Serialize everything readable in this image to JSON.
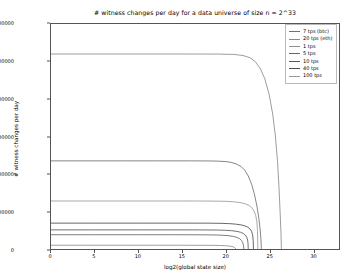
{
  "chart_data": {
    "type": "line",
    "title": "# witness changes per day for a data universe of size n = 2^33",
    "xlabel": "log2(global state size)",
    "ylabel": "# witness changes per day",
    "xlim": [
      0,
      33
    ],
    "ylim": [
      0,
      3000000
    ],
    "xticks": [
      0,
      5,
      10,
      15,
      20,
      25,
      30
    ],
    "xtick_labels": [
      "0",
      "5",
      "10",
      "15",
      "20",
      "25",
      "30"
    ],
    "yticks": [
      0,
      500000,
      1000000,
      1500000,
      2000000,
      2500000,
      3000000
    ],
    "ytick_labels": [
      "0",
      "500000",
      "1000000",
      "1500000",
      "2000000",
      "2500000",
      "3000000"
    ],
    "grid": false,
    "legend_position": "upper right",
    "series": [
      {
        "name": "7 tps (btc)",
        "color": "#707070",
        "plateau": 1175000,
        "dropoff_start": 20.0,
        "zero_at": 24.1,
        "points": [
          [
            0,
            1175000
          ],
          [
            4,
            1175000
          ],
          [
            8,
            1175000
          ],
          [
            12,
            1175000
          ],
          [
            16,
            1175000
          ],
          [
            18,
            1174000
          ],
          [
            19,
            1172000
          ],
          [
            20,
            1166000
          ],
          [
            20.6,
            1156000
          ],
          [
            21.2,
            1136000
          ],
          [
            21.8,
            1098000
          ],
          [
            22.2,
            1050000
          ],
          [
            22.6,
            975000
          ],
          [
            23.0,
            860000
          ],
          [
            23.3,
            735000
          ],
          [
            23.6,
            570000
          ],
          [
            23.8,
            420000
          ],
          [
            23.95,
            275000
          ],
          [
            24.05,
            140000
          ],
          [
            24.1,
            0
          ]
        ]
      },
      {
        "name": "20 tps (eth)",
        "color": "#8a8a8a",
        "plateau": 2600000,
        "dropoff_start": 21.5,
        "zero_at": 26.4,
        "points": [
          [
            0,
            2600000
          ],
          [
            5,
            2600000
          ],
          [
            10,
            2600000
          ],
          [
            15,
            2600000
          ],
          [
            19,
            2599000
          ],
          [
            21,
            2594000
          ],
          [
            22,
            2580000
          ],
          [
            22.8,
            2550000
          ],
          [
            23.4,
            2500000
          ],
          [
            24.0,
            2400000
          ],
          [
            24.5,
            2270000
          ],
          [
            25.0,
            2060000
          ],
          [
            25.4,
            1800000
          ],
          [
            25.7,
            1520000
          ],
          [
            25.95,
            1180000
          ],
          [
            26.12,
            830000
          ],
          [
            26.25,
            500000
          ],
          [
            26.35,
            220000
          ],
          [
            26.4,
            0
          ]
        ]
      },
      {
        "name": "1 tps",
        "color": "#8e8e8e",
        "plateau": 50000,
        "dropoff_start": 17.5,
        "zero_at": 21.2,
        "points": [
          [
            0,
            50000
          ],
          [
            4,
            50000
          ],
          [
            8,
            50000
          ],
          [
            12,
            50000
          ],
          [
            15,
            49900
          ],
          [
            17,
            49600
          ],
          [
            18,
            49100
          ],
          [
            18.8,
            48200
          ],
          [
            19.4,
            46800
          ],
          [
            19.9,
            44500
          ],
          [
            20.3,
            41000
          ],
          [
            20.6,
            36500
          ],
          [
            20.85,
            30000
          ],
          [
            21.0,
            21000
          ],
          [
            21.1,
            12000
          ],
          [
            21.2,
            0
          ]
        ]
      },
      {
        "name": "5 tps",
        "color": "#666666",
        "plateau": 190000,
        "dropoff_start": 18.4,
        "zero_at": 22.1,
        "points": [
          [
            0,
            190000
          ],
          [
            5,
            190000
          ],
          [
            10,
            190000
          ],
          [
            14,
            190000
          ],
          [
            16,
            189600
          ],
          [
            18,
            188500
          ],
          [
            19,
            186500
          ],
          [
            19.8,
            182500
          ],
          [
            20.4,
            176500
          ],
          [
            20.9,
            167500
          ],
          [
            21.3,
            154000
          ],
          [
            21.6,
            138000
          ],
          [
            21.82,
            116000
          ],
          [
            21.96,
            86000
          ],
          [
            22.05,
            50000
          ],
          [
            22.1,
            0
          ]
        ]
      },
      {
        "name": "10 tps",
        "color": "#5a5a5a",
        "plateau": 255000,
        "dropoff_start": 18.8,
        "zero_at": 22.6,
        "points": [
          [
            0,
            255000
          ],
          [
            5,
            255000
          ],
          [
            10,
            255000
          ],
          [
            15,
            255000
          ],
          [
            17,
            254600
          ],
          [
            19,
            253000
          ],
          [
            20,
            249500
          ],
          [
            20.7,
            244000
          ],
          [
            21.3,
            235000
          ],
          [
            21.7,
            224000
          ],
          [
            22.0,
            209000
          ],
          [
            22.25,
            188000
          ],
          [
            22.42,
            160000
          ],
          [
            22.53,
            120000
          ],
          [
            22.58,
            70000
          ],
          [
            22.6,
            0
          ]
        ]
      },
      {
        "name": "40 tps",
        "color": "#4e4e4e",
        "plateau": 345000,
        "dropoff_start": 19.3,
        "zero_at": 23.2,
        "points": [
          [
            0,
            345000
          ],
          [
            5,
            345000
          ],
          [
            10,
            345000
          ],
          [
            15,
            345000
          ],
          [
            18,
            344400
          ],
          [
            19.5,
            342000
          ],
          [
            20.5,
            337500
          ],
          [
            21.2,
            331000
          ],
          [
            21.8,
            321000
          ],
          [
            22.2,
            309000
          ],
          [
            22.55,
            291000
          ],
          [
            22.8,
            268000
          ],
          [
            22.98,
            237000
          ],
          [
            23.1,
            190000
          ],
          [
            23.17,
            110000
          ],
          [
            23.2,
            0
          ]
        ]
      },
      {
        "name": "100 tps",
        "color": "#9a9a9a",
        "plateau": 640000,
        "dropoff_start": 19.8,
        "zero_at": 23.7,
        "points": [
          [
            0,
            640000
          ],
          [
            5,
            640000
          ],
          [
            10,
            640000
          ],
          [
            15,
            640000
          ],
          [
            18,
            639500
          ],
          [
            20,
            636000
          ],
          [
            21,
            629000
          ],
          [
            21.8,
            616000
          ],
          [
            22.3,
            601000
          ],
          [
            22.7,
            580000
          ],
          [
            23.0,
            551000
          ],
          [
            23.25,
            508000
          ],
          [
            23.45,
            450000
          ],
          [
            23.58,
            370000
          ],
          [
            23.66,
            250000
          ],
          [
            23.7,
            0
          ]
        ]
      }
    ]
  }
}
